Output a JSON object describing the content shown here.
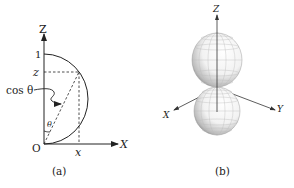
{
  "panel_a": {
    "caption": "(a)",
    "axis_z_label": "Z",
    "axis_x_label": "X",
    "origin_label": "O",
    "unit_tick_label": "1",
    "z_tick_label": "z",
    "x_tick_label": "x",
    "cos_label": "cos θ",
    "theta_label": "θ"
  },
  "panel_b": {
    "caption": "(b)",
    "axis_z_label": "Z",
    "axis_x_label": "X",
    "axis_y_label": "Y"
  },
  "colors": {
    "line": "#222222",
    "sphere_light": "#ffffff",
    "sphere_dark": "#8a8a8a"
  }
}
